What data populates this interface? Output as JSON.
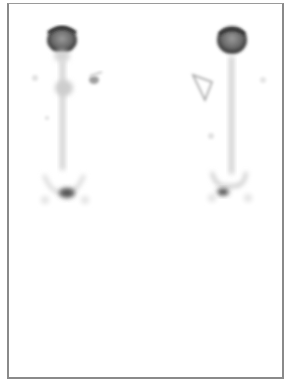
{
  "image": {
    "kind": "bone-scintigraphy",
    "views": [
      {
        "name": "view-left",
        "center_x": 63
      },
      {
        "name": "view-right",
        "center_x": 231
      }
    ],
    "colors": {
      "background": "#ffffff",
      "frame": "#8a8a8a",
      "uptake_dark": "#1a1a1a",
      "uptake_light": "#bdbdbd"
    }
  }
}
